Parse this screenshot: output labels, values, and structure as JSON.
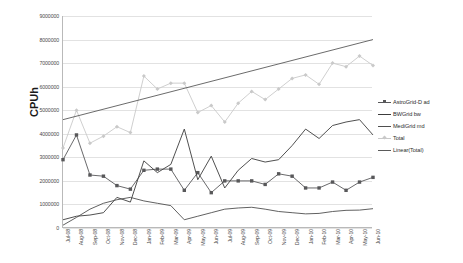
{
  "chart_data": {
    "type": "line",
    "title": "",
    "xlabel": "",
    "ylabel": "CPUh",
    "ylim": [
      0,
      9000000
    ],
    "ytick_labels": [
      "9000000",
      "8000000",
      "7000000",
      "6000000",
      "5000000",
      "4000000",
      "3000000",
      "2000000",
      "1000000",
      "0"
    ],
    "ytick_values": [
      9000000,
      8000000,
      7000000,
      6000000,
      5000000,
      4000000,
      3000000,
      2000000,
      1000000,
      0
    ],
    "grid": true,
    "legend_position": "right",
    "categories": [
      "Jul-08",
      "Aug-08",
      "Sep-08",
      "Oct-08",
      "Nov-08",
      "Dec-08",
      "Jan-09",
      "Feb-09",
      "Mar-09",
      "Apr-09",
      "May-09",
      "Jun-09",
      "Jul-09",
      "Aug-09",
      "Sep-09",
      "Oct-09",
      "Nov-09",
      "Dec-09",
      "Jan-10",
      "Feb-10",
      "Mar-10",
      "Apr-10",
      "May-10",
      "Jun-10"
    ],
    "series": [
      {
        "name": "AstroGrid-D ad",
        "color": "#58585a",
        "marker": "square",
        "values": [
          2900000,
          3950000,
          2250000,
          2200000,
          1800000,
          1650000,
          2450000,
          2500000,
          2500000,
          1600000,
          2350000,
          1500000,
          2000000,
          2000000,
          2000000,
          1850000,
          2300000,
          2200000,
          1700000,
          1700000,
          1950000,
          1600000,
          1950000,
          2150000
        ]
      },
      {
        "name": "BWGrid bw",
        "color": "#3c3c3c",
        "marker": "none",
        "values": [
          350000,
          500000,
          550000,
          650000,
          1300000,
          1100000,
          2850000,
          2350000,
          2700000,
          4200000,
          2050000,
          3050000,
          1700000,
          2450000,
          2950000,
          2800000,
          2900000,
          3500000,
          4200000,
          3800000,
          4350000,
          4500000,
          4600000,
          3950000
        ]
      },
      {
        "name": "MediGrid md",
        "color": "#4f4f4f",
        "marker": "none",
        "values": [
          120000,
          450000,
          800000,
          1050000,
          1200000,
          1300000,
          1150000,
          1050000,
          950000,
          350000,
          500000,
          650000,
          800000,
          850000,
          880000,
          800000,
          700000,
          650000,
          600000,
          620000,
          700000,
          750000,
          760000,
          820000
        ]
      },
      {
        "name": "Total",
        "color": "#c9c9c9",
        "marker": "diamond",
        "values": [
          3400000,
          5000000,
          3600000,
          3900000,
          4300000,
          4050000,
          6450000,
          5900000,
          6150000,
          6150000,
          4900000,
          5200000,
          4500000,
          5300000,
          5800000,
          5450000,
          5900000,
          6350000,
          6500000,
          6100000,
          7000000,
          6850000,
          7300000,
          6900000
        ]
      },
      {
        "name": "Linear(Total)",
        "color": "#5a5a5a",
        "marker": "none",
        "trend_start": 4600000,
        "trend_end": 8000000
      }
    ],
    "legend_entries": [
      {
        "label": "AstroGrid-D ad",
        "color": "#58585a",
        "marker": "square"
      },
      {
        "label": "BWGrid bw",
        "color": "#3c3c3c",
        "marker": "none"
      },
      {
        "label": "MediGrid md",
        "color": "#4f4f4f",
        "marker": "none"
      },
      {
        "label": "Total",
        "color": "#c9c9c9",
        "marker": "diamond"
      },
      {
        "label": "Linear(Total)",
        "color": "#5a5a5a",
        "marker": "none"
      }
    ]
  }
}
